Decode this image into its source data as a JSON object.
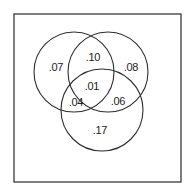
{
  "diagram": {
    "type": "venn-3-set",
    "frame": {
      "x": 14,
      "y": 14,
      "width": 167,
      "height": 168
    },
    "circles": [
      {
        "name": "set-a",
        "cx": 74,
        "cy": 72,
        "r": 40
      },
      {
        "name": "set-b",
        "cx": 108,
        "cy": 72,
        "r": 40
      },
      {
        "name": "set-c",
        "cx": 102,
        "cy": 110,
        "r": 41
      }
    ],
    "regions": {
      "a_only": {
        "label": ".07",
        "x": 56,
        "y": 67
      },
      "b_only": {
        "label": ".08",
        "x": 131,
        "y": 67
      },
      "c_only": {
        "label": ".17",
        "x": 100,
        "y": 130
      },
      "a_b": {
        "label": ".10",
        "x": 93,
        "y": 57
      },
      "a_c": {
        "label": ".04",
        "x": 76,
        "y": 102
      },
      "b_c": {
        "label": ".06",
        "x": 118,
        "y": 101
      },
      "a_b_c": {
        "label": ".01",
        "x": 92,
        "y": 86
      }
    }
  }
}
